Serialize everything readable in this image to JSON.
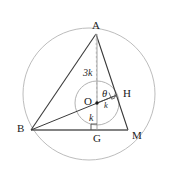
{
  "figure": {
    "width": 174,
    "height": 172,
    "background_color": "#ffffff",
    "stroke_color": "#3a3a3a",
    "circle_color": "#b0b0b0",
    "incircle_color": "#a8a8a8",
    "dash_color": "#b8b8b8"
  },
  "vertices": {
    "A": {
      "label": "A",
      "x": 96,
      "y": 34
    },
    "B": {
      "label": "B",
      "x": 31,
      "y": 130
    },
    "M": {
      "label": "M",
      "x": 128,
      "y": 130
    },
    "G": {
      "label": "G",
      "x": 97,
      "y": 130
    },
    "H": {
      "label": "H",
      "x": 117,
      "y": 95
    },
    "O": {
      "label": "O",
      "x": 97,
      "y": 103
    }
  },
  "labels": {
    "A": "A",
    "B": "B",
    "M": "M",
    "G": "G",
    "H": "H",
    "O": "O",
    "theta": "θ",
    "segment_AO": "3k",
    "segment_OG": "k",
    "segment_OH": "k"
  },
  "circles": {
    "circumcircle": {
      "cx": 89,
      "cy": 94,
      "r": 66
    },
    "incircle": {
      "cx": 97,
      "cy": 103,
      "r": 22
    }
  },
  "marks": {
    "right_angle_at_G": "right-angle",
    "right_angle_at_H": "right-angle",
    "center_dot_O": "point"
  }
}
